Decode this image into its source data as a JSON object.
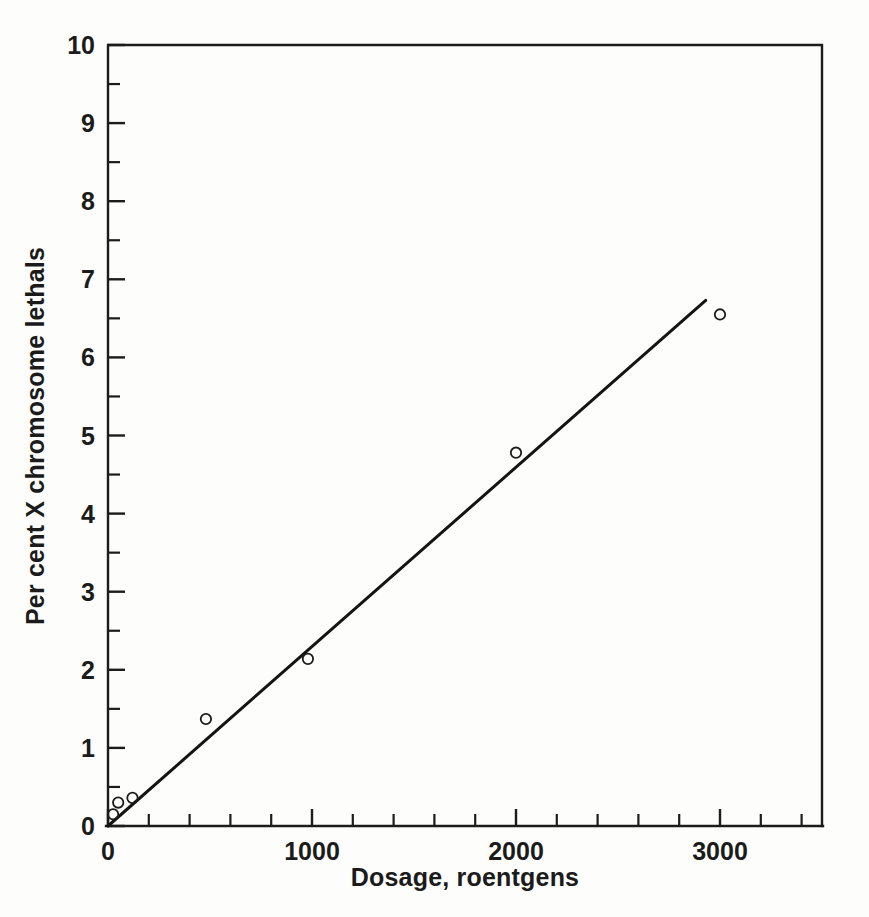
{
  "figure": {
    "background_color": "#fdfdfc",
    "ink_color": "#1c1c1c"
  },
  "chart_data": {
    "type": "scatter",
    "title": "",
    "subtitle": "",
    "xlabel": "Dosage, roentgens",
    "ylabel": "Per cent X chromosome lethals",
    "xlim": [
      0,
      3500
    ],
    "ylim": [
      0,
      10
    ],
    "grid": false,
    "legend": null,
    "x_major_ticks": [
      0,
      1000,
      2000,
      3000
    ],
    "x_major_tick_labels": [
      "0",
      "1000",
      "2000",
      "3000"
    ],
    "x_minor_tick_interval": 200,
    "y_major_ticks": [
      0,
      1,
      2,
      3,
      4,
      5,
      6,
      7,
      8,
      9,
      10
    ],
    "y_major_tick_labels": [
      "0",
      "1",
      "2",
      "3",
      "4",
      "5",
      "6",
      "7",
      "8",
      "9",
      "10"
    ],
    "y_minor_tick_interval": 0.5,
    "marker_style": "open-circle",
    "points": [
      {
        "x": 25,
        "y": 0.15
      },
      {
        "x": 50,
        "y": 0.3
      },
      {
        "x": 120,
        "y": 0.36
      },
      {
        "x": 480,
        "y": 1.37
      },
      {
        "x": 980,
        "y": 2.14
      },
      {
        "x": 2000,
        "y": 4.78
      },
      {
        "x": 3000,
        "y": 6.55
      }
    ],
    "series": [
      {
        "name": "X chromosome lethals vs dosage",
        "x": [
          25,
          50,
          120,
          480,
          980,
          2000,
          3000
        ],
        "values": [
          0.15,
          0.3,
          0.36,
          1.37,
          2.14,
          4.78,
          6.55
        ]
      }
    ],
    "fit_line": {
      "type": "linear",
      "x_start": 0,
      "y_start": 0.0,
      "x_end": 2930,
      "y_end": 6.73,
      "slope_per_roentgen": 0.0023
    },
    "annotations": []
  }
}
